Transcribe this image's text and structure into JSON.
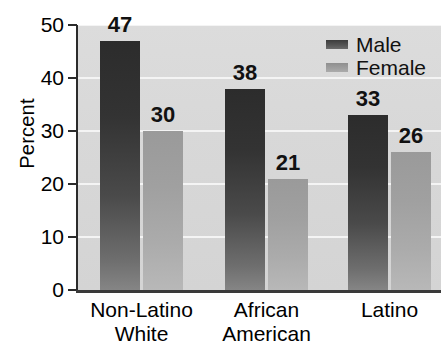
{
  "chart_data": {
    "type": "bar",
    "title": "",
    "subtitle": "",
    "xlabel": "",
    "ylabel": "Percent",
    "ylim": [
      0,
      50
    ],
    "yticks": [
      0,
      10,
      20,
      30,
      40,
      50
    ],
    "ytick_labels": [
      "0",
      "10",
      "20",
      "30",
      "40",
      "50"
    ],
    "grid": "horizontal",
    "legend_position": "top-right-inside",
    "categories": [
      "Non-Latino White",
      "African American",
      "Latino"
    ],
    "category_lines": [
      [
        "Non-Latino",
        "White"
      ],
      [
        "African",
        "American"
      ],
      [
        "Latino"
      ]
    ],
    "series": [
      {
        "name": "Male",
        "values": [
          47,
          38,
          33
        ],
        "color": "#3a3a3a"
      },
      {
        "name": "Female",
        "values": [
          30,
          21,
          26
        ],
        "color": "#a3a3a3"
      }
    ],
    "data_labels": [
      "47",
      "30",
      "38",
      "21",
      "33",
      "26"
    ],
    "plot_background": "#d8d8d8",
    "gridline_color": "#f4f4f4",
    "axis_color": "#2b2b2b"
  },
  "axis": {
    "y_title": "Percent",
    "ticks": [
      {
        "label": "50",
        "value": 50
      },
      {
        "label": "40",
        "value": 40
      },
      {
        "label": "30",
        "value": 30
      },
      {
        "label": "20",
        "value": 20
      },
      {
        "label": "10",
        "value": 10
      },
      {
        "label": "0",
        "value": 0
      }
    ]
  },
  "legend": {
    "items": [
      {
        "label": "Male"
      },
      {
        "label": "Female"
      }
    ]
  },
  "groups": [
    {
      "line1": "Non-Latino",
      "line2": "White",
      "male": {
        "value": 47,
        "label": "47"
      },
      "female": {
        "value": 30,
        "label": "30"
      }
    },
    {
      "line1": "African",
      "line2": "American",
      "male": {
        "value": 38,
        "label": "38"
      },
      "female": {
        "value": 21,
        "label": "21"
      }
    },
    {
      "line1": "Latino",
      "line2": "",
      "male": {
        "value": 33,
        "label": "33"
      },
      "female": {
        "value": 26,
        "label": "26"
      }
    }
  ]
}
